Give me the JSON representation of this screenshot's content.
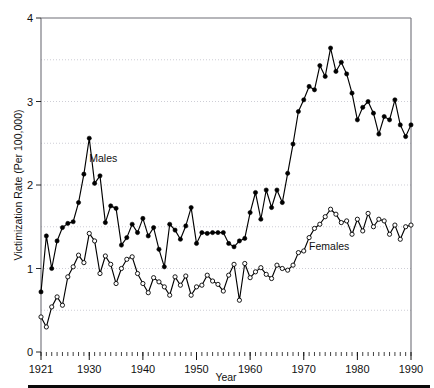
{
  "figure": {
    "background": "#ffffff",
    "bottom_rule_color": "#0a0a0a"
  },
  "labels": {
    "y_axis_title": "Victimization Rate (Per 100,000)",
    "x_axis_title": "Year",
    "males_label": "Males",
    "females_label": "Females"
  },
  "chart_data": {
    "type": "line",
    "title": "",
    "xlabel": "Year",
    "ylabel": "Victimization Rate (Per 100,000)",
    "xlim": [
      1921,
      1990
    ],
    "ylim": [
      0,
      4
    ],
    "yticks": [
      0,
      1,
      2,
      3,
      4
    ],
    "ytick_labels": [
      "0",
      "1",
      "2",
      "3",
      "4"
    ],
    "xticks": [
      1921,
      1930,
      1940,
      1950,
      1960,
      1970,
      1980,
      1990
    ],
    "xtick_labels": [
      "1921",
      "1930",
      "1940",
      "1950",
      "1960",
      "1970",
      "1980",
      "1990"
    ],
    "minor_xtick_interval": 1,
    "grid": "horizontal-dotted-at-0.5-intervals",
    "gridlines": [
      0.5,
      1.0,
      1.5,
      2.0,
      2.5,
      3.0,
      3.5
    ],
    "legend": "inline-annotations",
    "annotations": [
      {
        "text": "Males",
        "x": 1930,
        "y": 2.27
      },
      {
        "text": "Females",
        "x": 1971,
        "y": 1.22
      }
    ],
    "x": [
      1921,
      1922,
      1923,
      1924,
      1925,
      1926,
      1927,
      1928,
      1929,
      1930,
      1931,
      1932,
      1933,
      1934,
      1935,
      1936,
      1937,
      1938,
      1939,
      1940,
      1941,
      1942,
      1943,
      1944,
      1945,
      1946,
      1947,
      1948,
      1949,
      1950,
      1951,
      1952,
      1953,
      1954,
      1955,
      1956,
      1957,
      1958,
      1959,
      1960,
      1961,
      1962,
      1963,
      1964,
      1965,
      1966,
      1967,
      1968,
      1969,
      1970,
      1971,
      1972,
      1973,
      1974,
      1975,
      1976,
      1977,
      1978,
      1979,
      1980,
      1981,
      1982,
      1983,
      1984,
      1985,
      1986,
      1987,
      1988,
      1989,
      1990
    ],
    "series": [
      {
        "name": "Males",
        "marker": "filled-circle",
        "color": "#000000",
        "values": [
          0.72,
          1.39,
          1.0,
          1.33,
          1.49,
          1.54,
          1.56,
          1.79,
          2.13,
          2.56,
          2.02,
          2.11,
          1.55,
          1.75,
          1.72,
          1.28,
          1.37,
          1.53,
          1.43,
          1.6,
          1.39,
          1.49,
          1.23,
          1.02,
          1.53,
          1.46,
          1.35,
          1.51,
          1.73,
          1.3,
          1.43,
          1.42,
          1.43,
          1.43,
          1.43,
          1.3,
          1.26,
          1.33,
          1.36,
          1.67,
          1.91,
          1.59,
          1.94,
          1.73,
          1.94,
          1.79,
          2.14,
          2.49,
          2.88,
          3.02,
          3.18,
          3.14,
          3.43,
          3.3,
          3.64,
          3.36,
          3.47,
          3.33,
          3.1,
          2.78,
          2.93,
          3.0,
          2.86,
          2.61,
          2.82,
          2.78,
          3.02,
          2.72,
          2.58,
          2.72
        ]
      },
      {
        "name": "Females",
        "marker": "open-circle",
        "color": "#000000",
        "values": [
          0.42,
          0.3,
          0.54,
          0.66,
          0.56,
          0.9,
          1.02,
          1.16,
          1.07,
          1.42,
          1.33,
          0.94,
          1.15,
          1.05,
          0.82,
          1.0,
          1.11,
          1.14,
          0.94,
          0.82,
          0.71,
          0.89,
          0.84,
          0.78,
          0.68,
          0.9,
          0.8,
          0.91,
          0.68,
          0.78,
          0.8,
          0.92,
          0.85,
          0.81,
          0.73,
          0.92,
          1.05,
          0.62,
          1.06,
          0.89,
          0.96,
          1.01,
          0.93,
          0.88,
          1.04,
          1.0,
          0.98,
          1.04,
          1.19,
          1.21,
          1.37,
          1.48,
          1.53,
          1.62,
          1.71,
          1.65,
          1.55,
          1.57,
          1.41,
          1.59,
          1.45,
          1.66,
          1.5,
          1.59,
          1.57,
          1.41,
          1.52,
          1.35,
          1.5,
          1.52
        ]
      }
    ]
  }
}
